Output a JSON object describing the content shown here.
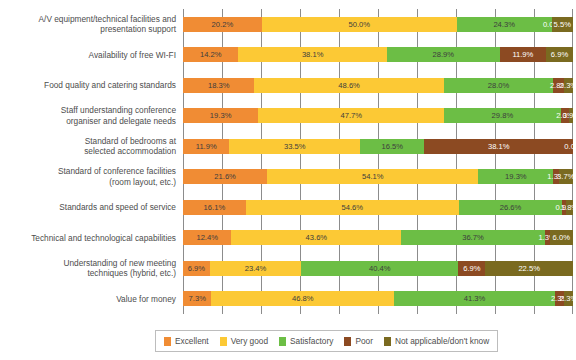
{
  "chart_data": {
    "type": "bar",
    "orientation": "horizontal",
    "stacked": true,
    "normalized_percent": true,
    "title": "",
    "subtitle": "",
    "xlabel": "",
    "ylabel": "",
    "xlim": [
      0,
      100
    ],
    "xticks": [
      0,
      10,
      20,
      30,
      40,
      50,
      60,
      70,
      80,
      90,
      100
    ],
    "xtick_labels": [],
    "grid": "vertical",
    "legend_position": "bottom",
    "value_suffix": "%",
    "categories": [
      "A/V equipment/technical facilities and presentation support",
      "Availability of free WI-FI",
      "Food quality and catering standards",
      "Staff understanding conference organiser and delegate needs",
      "Standard of bedrooms at selected accommodation",
      "Standard of conference facilities (room layout, etc.)",
      "Standards and speed of service",
      "Technical and technological capabilities",
      "Understanding of new meeting techniques (hybrid, etc.)",
      "Value for money"
    ],
    "category_labels_wrapped": [
      "A/V equipment/technical facilities and\npresentation support",
      "Availability of free WI-FI",
      "Food quality and catering standards",
      "Staff understanding conference\norganiser and delegate needs",
      "Standard of bedrooms at\nselected accommodation",
      "Standard of conference facilities\n(room layout, etc.)",
      "Standards and speed of service",
      "Technical and technological capabilities",
      "Understanding of new meeting\ntechniques (hybrid, etc.)",
      "Value for money"
    ],
    "series": [
      {
        "name": "Excellent",
        "color": "#F08C34",
        "values": [
          20.2,
          14.2,
          18.3,
          19.3,
          11.9,
          21.6,
          16.1,
          12.4,
          6.9,
          7.3
        ],
        "labels": [
          "20.2%",
          "14.2%",
          "18.3%",
          "19.3%",
          "11.9%",
          "21.6%",
          "16.1%",
          "12.4%",
          "6.9%",
          "7.3%"
        ]
      },
      {
        "name": "Very good",
        "color": "#FCC935",
        "values": [
          50.0,
          38.1,
          48.6,
          47.7,
          33.5,
          54.1,
          54.6,
          43.6,
          23.4,
          46.8
        ],
        "labels": [
          "50.0%",
          "38.1%",
          "48.6%",
          "47.7%",
          "33.5%",
          "54.1%",
          "54.6%",
          "43.6%",
          "23.4%",
          "46.8%"
        ]
      },
      {
        "name": "Satisfactory",
        "color": "#6CBE45",
        "values": [
          24.3,
          28.9,
          28.0,
          29.8,
          16.5,
          19.3,
          26.6,
          36.7,
          40.4,
          41.3
        ],
        "labels": [
          "24.3%",
          "28.9%",
          "28.0%",
          "29.8%",
          "16.5%",
          "19.3%",
          "26.6%",
          "36.7%",
          "40.4%",
          "41.3%"
        ]
      },
      {
        "name": "Poor",
        "color": "#8C4A22",
        "values": [
          0.0,
          11.9,
          2.8,
          2.3,
          38.1,
          1.3,
          0.9,
          1.3,
          6.9,
          2.3
        ],
        "labels": [
          "0.0%",
          "11.9%",
          "2.8%",
          "2.3%",
          "38.1%",
          "1.3%",
          "0.9%",
          "1.3%",
          "6.9%",
          "2.3%"
        ]
      },
      {
        "name": "Not applicable/don't know",
        "color": "#7A6A20",
        "values": [
          5.5,
          6.9,
          2.3,
          0.9,
          0.0,
          3.7,
          1.8,
          6.0,
          22.5,
          2.3
        ],
        "labels": [
          "5.5%",
          "6.9%",
          "2.3%",
          "0.9%",
          "0.0%",
          "3.7%",
          "1.8%",
          "6.0%",
          "22.5%",
          "2.3%"
        ]
      }
    ]
  },
  "legend": {
    "items": [
      {
        "label": "Excellent",
        "color": "#F08C34"
      },
      {
        "label": "Very good",
        "color": "#FCC935"
      },
      {
        "label": "Satisfactory",
        "color": "#6CBE45"
      },
      {
        "label": "Poor",
        "color": "#8C4A22"
      },
      {
        "label": "Not applicable/don't know",
        "color": "#7A6A20"
      }
    ]
  },
  "colors": {
    "excellent": "#F08C34",
    "very_good": "#FCC935",
    "satisfactory": "#6CBE45",
    "poor": "#8C4A22",
    "not_applicable": "#7A6A20",
    "gridline": "#8C8C8C",
    "text": "#4D4D4D",
    "background": "#FFFFFF"
  }
}
